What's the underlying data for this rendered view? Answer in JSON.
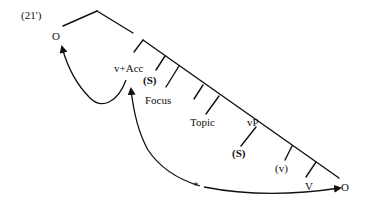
{
  "example_number": "(21')",
  "nodes": {
    "object_high": "O",
    "v_acc": "v+Acc",
    "subject_focus": "(S)",
    "focus": "Focus",
    "topic": "Topic",
    "vp": "vP",
    "subject_vp": "(S)",
    "little_v": "(v)",
    "verb": "V",
    "object_low": "O"
  },
  "annotations": {
    "blocked_movement_mark": "*"
  },
  "colors": {
    "ink": "#111111",
    "background": "#ffffff"
  }
}
